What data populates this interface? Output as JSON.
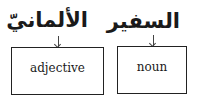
{
  "diagram": {
    "items": [
      {
        "word": "الألمانيّ",
        "label": "adjective"
      },
      {
        "word": "السفير",
        "label": "noun"
      }
    ]
  }
}
